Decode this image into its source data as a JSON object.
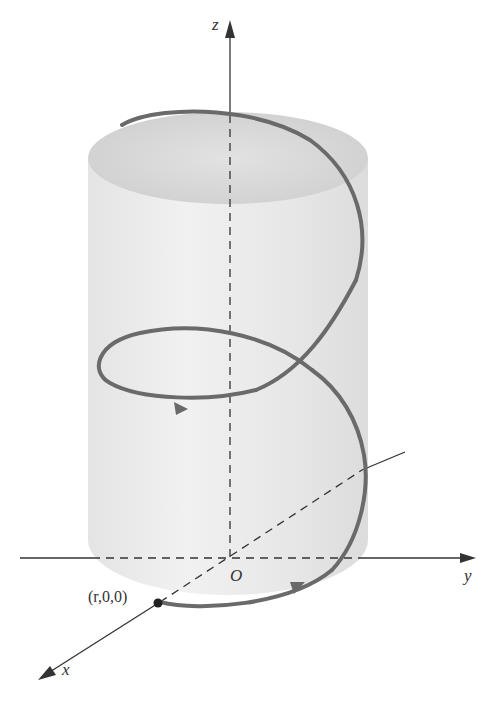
{
  "figure": {
    "labels": {
      "z_axis": "z",
      "y_axis": "y",
      "x_axis": "x",
      "origin": "O",
      "point": "(r,0,0)"
    },
    "colors": {
      "curve": "#6a6a6a",
      "axis": "#333333",
      "cylinder": "#e9e9e9",
      "cylinder_top": "#d6d6d6"
    }
  }
}
